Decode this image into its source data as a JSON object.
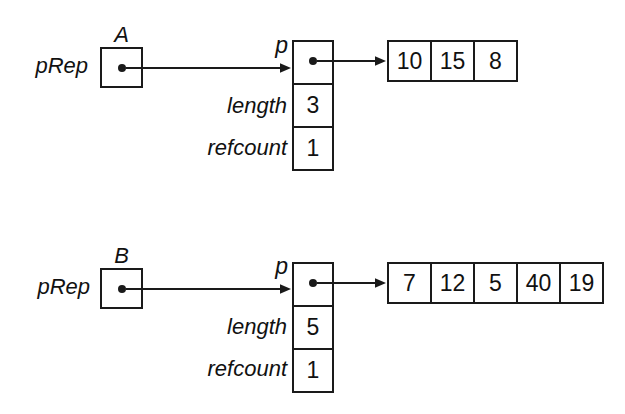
{
  "diagram": {
    "description_colors": {
      "line": "#1a1a1a",
      "text": "#111111",
      "background": "#ffffff"
    },
    "groups": [
      {
        "object_label": "A",
        "pointer_label": "pRep",
        "struct_field_p": "p",
        "struct_field_length": "length",
        "struct_field_refcount": "refcount",
        "length_value": "3",
        "refcount_value": "1",
        "array_values": [
          "10",
          "15",
          "8"
        ]
      },
      {
        "object_label": "B",
        "pointer_label": "pRep",
        "struct_field_p": "p",
        "struct_field_length": "length",
        "struct_field_refcount": "refcount",
        "length_value": "5",
        "refcount_value": "1",
        "array_values": [
          "7",
          "12",
          "5",
          "40",
          "19"
        ]
      }
    ]
  }
}
